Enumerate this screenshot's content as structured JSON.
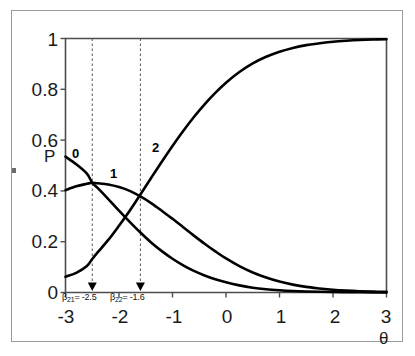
{
  "chart_data": {
    "type": "line",
    "title": "",
    "subtitle": "",
    "xlabel": "θ",
    "ylabel": "P",
    "xlim": [
      -3,
      3
    ],
    "ylim": [
      0,
      1
    ],
    "grid": false,
    "legend_position": "inline-curve-labels",
    "x_ticks": [
      "-3",
      "-2",
      "-1",
      "0",
      "1",
      "2",
      "3"
    ],
    "x_tick_values": [
      -3,
      -2,
      -1,
      0,
      1,
      2,
      3
    ],
    "y_ticks": [
      "0",
      "0.2",
      "0.4",
      "0.6",
      "0.8",
      "1"
    ],
    "y_tick_values": [
      0,
      0.2,
      0.4,
      0.6,
      0.8,
      1
    ],
    "x": [
      -3,
      -2.8,
      -2.6,
      -2.5,
      -2.4,
      -2.2,
      -2,
      -1.8,
      -1.6,
      -1.4,
      -1.2,
      -1,
      -0.8,
      -0.6,
      -0.4,
      -0.2,
      0,
      0.25,
      0.5,
      0.75,
      1,
      1.25,
      1.5,
      1.75,
      2,
      2.25,
      2.5,
      2.75,
      3
    ],
    "series": [
      {
        "name": "0",
        "label": "0",
        "color": "#000000",
        "values": [
          0.535,
          0.505,
          0.468,
          0.432,
          0.412,
          0.368,
          0.322,
          0.278,
          0.236,
          0.197,
          0.163,
          0.133,
          0.107,
          0.085,
          0.067,
          0.052,
          0.04,
          0.028,
          0.019,
          0.013,
          0.009,
          0.006,
          0.004,
          0.0027,
          0.0018,
          0.0012,
          0.0008,
          0.0005,
          0.0003
        ]
      },
      {
        "name": "1",
        "label": "1",
        "color": "#000000",
        "values": [
          0.403,
          0.418,
          0.428,
          0.432,
          0.43,
          0.425,
          0.415,
          0.4,
          0.378,
          0.352,
          0.322,
          0.29,
          0.257,
          0.224,
          0.192,
          0.162,
          0.134,
          0.104,
          0.079,
          0.059,
          0.043,
          0.031,
          0.022,
          0.016,
          0.011,
          0.0076,
          0.0052,
          0.0036,
          0.0024
        ]
      },
      {
        "name": "2",
        "label": "2",
        "color": "#000000",
        "values": [
          0.062,
          0.077,
          0.104,
          0.132,
          0.158,
          0.207,
          0.263,
          0.322,
          0.386,
          0.451,
          0.515,
          0.577,
          0.636,
          0.691,
          0.741,
          0.786,
          0.826,
          0.868,
          0.902,
          0.928,
          0.948,
          0.963,
          0.974,
          0.981,
          0.987,
          0.991,
          0.994,
          0.996,
          0.9973
        ]
      }
    ],
    "annotations": [
      {
        "name": "beta-21",
        "text": "β",
        "subscript": "21",
        "equals_value": "= -2.5",
        "full_text": "β₂₁= -2.5",
        "x_value": -2.5,
        "marker": "downward-arrow",
        "line_style": "dashed"
      },
      {
        "name": "beta-22",
        "text": "β",
        "subscript": "22",
        "equals_value": "= -1.6",
        "full_text": "β₂₂= -1.6",
        "x_value": -1.6,
        "marker": "downward-arrow",
        "line_style": "dashed"
      }
    ]
  },
  "axis_labels": {
    "y_axis_name": "P",
    "x_axis_name": "θ"
  },
  "colors": {
    "curve": "#000000",
    "axis": "#4d4d4d",
    "frame": "#9a9a9a",
    "dashed_guide": "#555555",
    "background": "#ffffff"
  }
}
